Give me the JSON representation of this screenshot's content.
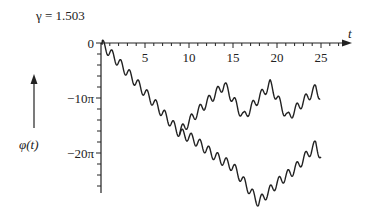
{
  "chart_data": {
    "type": "line",
    "title": "γ = 1.503",
    "xlabel": "t",
    "ylabel": "φ(t)",
    "xlim": [
      0,
      28
    ],
    "ylim_in_pi": [
      -27,
      0
    ],
    "x_ticks": [
      5,
      10,
      15,
      20,
      25
    ],
    "x_tick_labels": [
      "5",
      "10",
      "15",
      "20",
      "25"
    ],
    "x_minor_step": 1,
    "y_ticks_in_pi": [
      0,
      -10,
      -20
    ],
    "y_tick_labels": [
      "0",
      "−10π",
      "−20π"
    ],
    "y_minor_step_in_pi": 2,
    "grid": false,
    "series": [
      {
        "name": "common descent",
        "note": "φ in units of π",
        "envelope": [
          [
            0,
            0
          ],
          [
            2,
            -3.5
          ],
          [
            4,
            -7.2
          ],
          [
            6,
            -10.8
          ],
          [
            8,
            -14.6
          ],
          [
            8.9,
            -16.3
          ]
        ]
      },
      {
        "name": "upper branch",
        "envelope": [
          [
            8.9,
            -16.3
          ],
          [
            11,
            -12.5
          ],
          [
            14,
            -7.6
          ],
          [
            16.2,
            -13.5
          ],
          [
            19.2,
            -7.5
          ],
          [
            21.2,
            -13.6
          ],
          [
            24.4,
            -8.3
          ],
          [
            24.9,
            -9.6
          ]
        ]
      },
      {
        "name": "lower branch",
        "envelope": [
          [
            8.9,
            -16.3
          ],
          [
            10.5,
            -17.5
          ],
          [
            13,
            -20.6
          ],
          [
            15,
            -22.5
          ],
          [
            17.9,
            -29
          ],
          [
            20,
            -25.5
          ],
          [
            22,
            -23
          ],
          [
            24.4,
            -18.5
          ],
          [
            25,
            -20.7
          ]
        ]
      }
    ],
    "oscillation": {
      "period_t": 1.0,
      "amplitude_pi": 0.9
    }
  },
  "labels": {
    "title": "γ = 1.503",
    "xaxis": "t",
    "yaxis": "φ(t)",
    "x0": "0"
  }
}
